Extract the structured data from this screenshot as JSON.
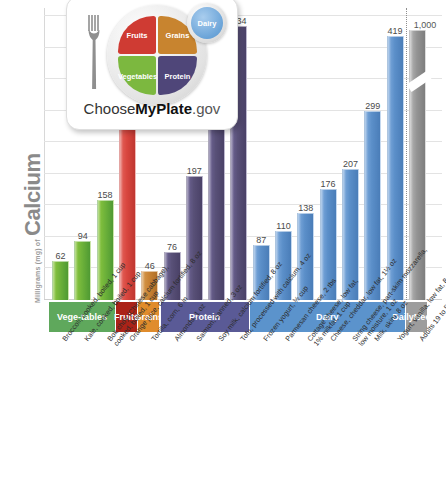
{
  "yaxis": {
    "unit_label": "Milligrams (mg) of",
    "nutrient": "Calcium"
  },
  "logo": {
    "name": "choose-myplate-logo",
    "text_light": "Choose",
    "text_bold": "MyPlate",
    "text_suffix": ".gov",
    "segments": [
      {
        "key": "fruits",
        "label": "Fruits",
        "color": "#cf3b33"
      },
      {
        "key": "grains",
        "label": "Grains",
        "color": "#c8842f"
      },
      {
        "key": "vegetables",
        "label": "Vegetables",
        "color": "#7cb83f"
      },
      {
        "key": "protein",
        "label": "Protein",
        "color": "#4f4679"
      },
      {
        "key": "dairy",
        "label": "Dairy",
        "color": "#6ba4d8"
      }
    ]
  },
  "bands": [
    {
      "label": "Vege-\ntables",
      "color": "#5fa85c",
      "span": 3
    },
    {
      "label": "Fruits",
      "color": "#ab2318",
      "span": 1
    },
    {
      "label": "Grains",
      "color": "#e08c2c",
      "span": 1
    },
    {
      "label": "Protein",
      "color": "#5a5a96",
      "span": 4
    },
    {
      "label": "Dairy",
      "color": "#5b93cc",
      "span": 7
    },
    {
      "label": "Daily\nNeeds",
      "color": "#9d9d9d",
      "span": 1
    }
  ],
  "chart_data": {
    "type": "bar",
    "title": "",
    "xlabel": "",
    "ylabel": "Milligrams (mg) of Calcium",
    "ylim": [
      0,
      450
    ],
    "grid": true,
    "axis_break_note": "Daily Needs bar (1,000 mg) is drawn with a scale break",
    "categories": [
      "Broccoli, cooked, boiled, 1 cup",
      "Kale, cooked, boiled, 1 cup",
      "Bok choy (Chinese cabbage),\ncooked, boiled, 1 cup",
      "Orange juice, calcium fortified, 8 oz",
      "Tortilla, corn, 6 in",
      "Almonds, 1 oz",
      "Salmon, canned, 3 oz",
      "Soy milk, calcium fortified, 8 oz",
      "Tofu, processed with calcium, 4 oz",
      "Frozen yogurt, ½ cup",
      "Parmesan cheese, 2 tbs",
      "Cottage cheese, low fat,\n1% milkfat, 1 cup",
      "Cheese, cheddar, low fat, 1½ oz",
      "String cheese, part-skim mozzarella,\nlow moisture, 1 oz",
      "Milk, skim, 8 oz",
      "Yogurt, vanilla, low fat, 8 oz",
      "Adults 19 to 50 years"
    ],
    "values": [
      62,
      94,
      158,
      349,
      46,
      76,
      197,
      299,
      434,
      87,
      110,
      138,
      176,
      207,
      299,
      419,
      1000
    ],
    "value_labels": [
      "62",
      "94",
      "158",
      "349",
      "46",
      "76",
      "197",
      "299",
      "434",
      "87",
      "110",
      "138",
      "176",
      "207",
      "299",
      "419",
      "1,000"
    ],
    "group": [
      "Vegetables",
      "Vegetables",
      "Vegetables",
      "Fruits",
      "Grains",
      "Protein",
      "Protein",
      "Protein",
      "Protein",
      "Dairy",
      "Dairy",
      "Dairy",
      "Dairy",
      "Dairy",
      "Dairy",
      "Dairy",
      "Daily Needs"
    ],
    "bar_colors": [
      "#6fb33a",
      "#6fb33a",
      "#6fb33a",
      "#d9473f",
      "#c98334",
      "#585077",
      "#585077",
      "#585077",
      "#585077",
      "#5b8fc9",
      "#5b8fc9",
      "#5b8fc9",
      "#5b8fc9",
      "#5b8fc9",
      "#5b8fc9",
      "#5b8fc9",
      "#949494"
    ]
  }
}
